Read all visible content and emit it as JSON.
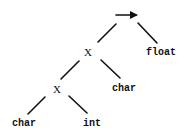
{
  "diagram": {
    "type": "tree",
    "root": {
      "label": "→",
      "icon": "arrow-right-icon",
      "children": [
        "x_upper",
        "float"
      ]
    },
    "nodes": {
      "x_upper": {
        "label": "X",
        "children": [
          "x_lower",
          "char_mid"
        ]
      },
      "x_lower": {
        "label": "X",
        "children": [
          "char_bottom",
          "int"
        ]
      },
      "float": {
        "label": "float"
      },
      "char_mid": {
        "label": "char"
      },
      "char_bottom": {
        "label": "char"
      },
      "int": {
        "label": "int"
      }
    }
  },
  "labels": {
    "x_upper": "X",
    "x_lower": "X",
    "float": "float",
    "char_mid": "char",
    "char_bottom": "char",
    "int": "int"
  },
  "colors": {
    "ink": "#111111",
    "background": "#ffffff"
  }
}
